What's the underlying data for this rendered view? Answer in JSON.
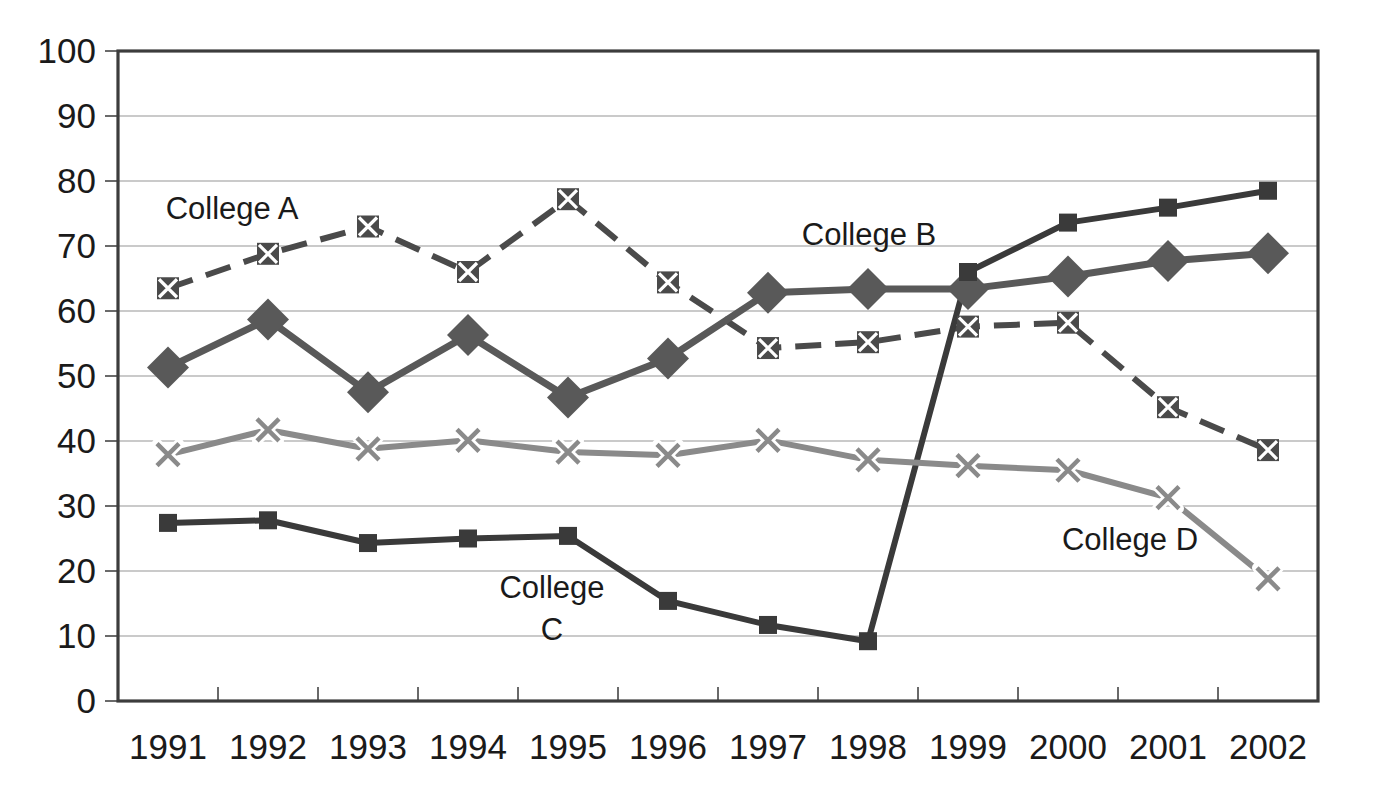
{
  "chart_data": {
    "type": "line",
    "title": "",
    "subtitle": "",
    "xlabel": "",
    "ylabel": "",
    "categories": [
      "1991",
      "1992",
      "1993",
      "1994",
      "1995",
      "1996",
      "1997",
      "1998",
      "1999",
      "2000",
      "2001",
      "2002"
    ],
    "x": [
      1991,
      1992,
      1993,
      1994,
      1995,
      1996,
      1997,
      1998,
      1999,
      2000,
      2001,
      2002
    ],
    "ylim": [
      0,
      100
    ],
    "yticks": [
      0,
      10,
      20,
      30,
      40,
      50,
      60,
      70,
      80,
      90,
      100
    ],
    "ytick_labels": [
      "0",
      "10",
      "20",
      "30",
      "40",
      "50",
      "60",
      "70",
      "80",
      "90",
      "100"
    ],
    "grid": true,
    "grid_axis": "y",
    "legend": "inline-annotations",
    "legend_position": "inside-plot",
    "series": [
      {
        "name": "College A",
        "values": [
          63.5,
          68.8,
          73.0,
          66.0,
          77.2,
          64.4,
          54.3,
          55.2,
          57.6,
          58.2,
          45.2,
          38.6
        ],
        "color": "#4a4a4a",
        "line_style": "dashed",
        "marker": "square-x",
        "marker_size": "small"
      },
      {
        "name": "College B",
        "values": [
          51.3,
          58.7,
          47.5,
          56.3,
          46.7,
          52.7,
          62.8,
          63.4,
          63.4,
          65.3,
          67.7,
          68.9
        ],
        "color": "#595959",
        "line_style": "solid",
        "marker": "diamond",
        "marker_size": "large"
      },
      {
        "name": "College C",
        "values": [
          27.4,
          27.8,
          24.3,
          25.0,
          25.4,
          15.4,
          11.7,
          9.2,
          66.0,
          73.6,
          75.9,
          78.5
        ],
        "color": "#3a3a3a",
        "line_style": "solid",
        "marker": "square",
        "marker_size": "small"
      },
      {
        "name": "College D",
        "values": [
          37.9,
          41.7,
          38.8,
          40.1,
          38.3,
          37.8,
          40.1,
          37.1,
          36.2,
          35.5,
          31.3,
          18.8
        ],
        "color": "#8a8a8a",
        "line_style": "solid",
        "marker": "x",
        "marker_size": "small"
      }
    ],
    "annotations": [
      {
        "text": "College A",
        "series": "College A",
        "x_px": 232,
        "y_px": 219
      },
      {
        "text": "College B",
        "series": "College B",
        "x_px": 869,
        "y_px": 245
      },
      {
        "text": "College C",
        "series": "College C",
        "line1": "College",
        "line2": "C",
        "x_px": 552,
        "y_px": 598
      },
      {
        "text": "College D",
        "series": "College D",
        "x_px": 1130,
        "y_px": 550
      }
    ]
  },
  "axes": {
    "plot_left_px": 118,
    "plot_right_px": 1318,
    "plot_top_px": 51,
    "plot_bottom_px": 701
  },
  "colors": {
    "background": "#ffffff",
    "axis": "#3c3c3c",
    "grid": "#b9b9b9",
    "text": "#1a1a1a",
    "college_a": "#4a4a4a",
    "college_b": "#595959",
    "college_c": "#3a3a3a",
    "college_d": "#8a8a8a"
  }
}
